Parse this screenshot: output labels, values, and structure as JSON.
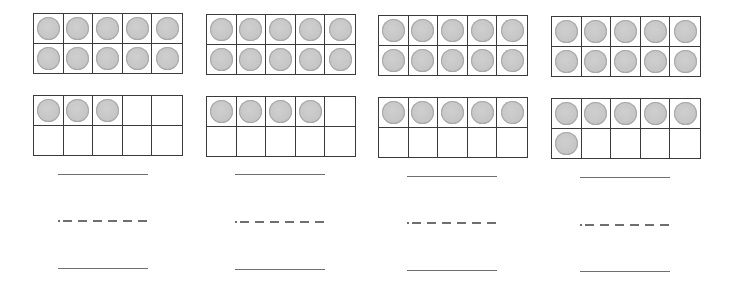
{
  "worksheet": {
    "columns": [
      {
        "top_frame_filled": 10,
        "bottom_frame_filled": 3,
        "total": 13,
        "answer_line": "",
        "dashed_line": "",
        "bottom_line": ""
      },
      {
        "top_frame_filled": 10,
        "bottom_frame_filled": 4,
        "total": 14,
        "answer_line": "",
        "dashed_line": "",
        "bottom_line": ""
      },
      {
        "top_frame_filled": 10,
        "bottom_frame_filled": 5,
        "total": 15,
        "answer_line": "",
        "dashed_line": "",
        "bottom_line": ""
      },
      {
        "top_frame_filled": 10,
        "bottom_frame_filled": 6,
        "total": 16,
        "answer_line": "",
        "dashed_line": "",
        "bottom_line": ""
      }
    ],
    "frame_cells": 10,
    "frame_layout": "5x2",
    "colors": {
      "counter_fill": "#c6c6c6",
      "counter_edge": "#a9a9a9",
      "grid_line": "#3a3a3a",
      "writing_line": "#6f6f6f"
    }
  }
}
